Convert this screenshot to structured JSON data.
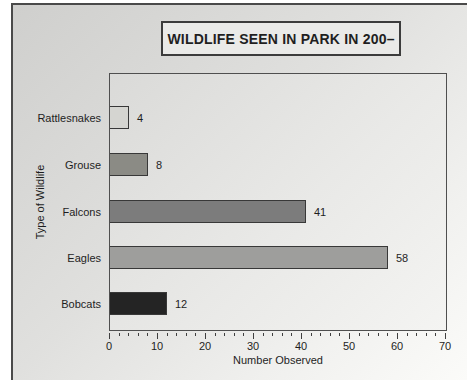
{
  "chart_data": {
    "type": "bar",
    "orientation": "horizontal",
    "title": "WILDLIFE SEEN IN PARK IN 200–",
    "categories": [
      "Rattlesnakes",
      "Grouse",
      "Falcons",
      "Eagles",
      "Bobcats"
    ],
    "values": [
      4,
      8,
      41,
      58,
      12
    ],
    "data_labels": [
      "4",
      "8",
      "41",
      "58",
      "12"
    ],
    "bar_colors": [
      "#d5d5d1",
      "#8b8b85",
      "#7c7c7c",
      "#9e9e9c",
      "#242424"
    ],
    "bar_border_color": "#383838",
    "xlabel": "Number Observed",
    "ylabel": "Type of Wildlife",
    "xlim": [
      0,
      70
    ],
    "x_major_ticks": [
      0,
      10,
      20,
      30,
      40,
      50,
      60,
      70
    ],
    "x_minor_tick_step": 2,
    "grid": false,
    "legend": "none"
  }
}
